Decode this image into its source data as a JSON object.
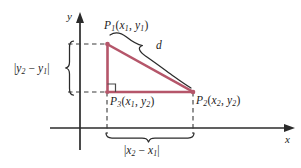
{
  "figure": {
    "colors": {
      "triangle": "#b5566a",
      "axis": "#2b2b2b",
      "dashed": "#3a3a3a",
      "brace": "#2b2b2b",
      "text": "#1c1c1c",
      "background": "#ffffff"
    }
  },
  "axes": {
    "x_label": "x",
    "y_label": "y"
  },
  "points": {
    "p1": {
      "name": "P",
      "sub": "1",
      "x_var": "x",
      "x_sub": "1",
      "y_var": "y",
      "y_sub": "1",
      "full": "P₁(x₁, y₁)"
    },
    "p2": {
      "name": "P",
      "sub": "2",
      "x_var": "x",
      "x_sub": "2",
      "y_var": "y",
      "y_sub": "2",
      "full": "P₂(x₂, y₂)"
    },
    "p3": {
      "name": "P",
      "sub": "3",
      "x_var": "x",
      "x_sub": "1",
      "y_var": "y",
      "y_sub": "2",
      "full": "P₃(x₁, y₂)"
    }
  },
  "measures": {
    "hypotenuse": "d",
    "vertical_leg": {
      "var_a": "y",
      "sub_a": "2",
      "operator": "−",
      "var_b": "y",
      "sub_b": "1",
      "full": "|y₂ − y₁|"
    },
    "horizontal_leg": {
      "var_a": "x",
      "sub_a": "2",
      "operator": "−",
      "var_b": "x",
      "sub_b": "1",
      "full": "|x₂ − x₁|"
    }
  },
  "geometry": {
    "p1_coords": [
      107,
      44
    ],
    "p2_coords": [
      193,
      92
    ],
    "p3_coords": [
      107,
      92
    ],
    "origin": [
      80,
      128
    ],
    "right_angle_marker": true
  }
}
